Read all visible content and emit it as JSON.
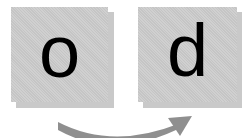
{
  "cards": [
    {
      "letter": "o",
      "color": "#cccccc"
    },
    {
      "letter": "d",
      "color": "#cccccc"
    }
  ],
  "arrow": {
    "direction": "left-to-right",
    "color": "#8f8f8f"
  }
}
